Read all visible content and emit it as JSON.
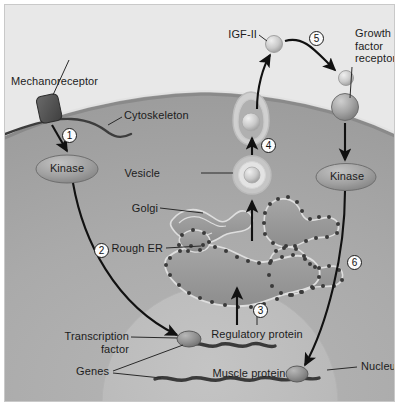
{
  "figure": {
    "type": "biological-cell-diagram"
  },
  "labels": {
    "mechanoreceptor": "Mechanoreceptor",
    "cytoskeleton": "Cytoskeleton",
    "kinase_left": "Kinase",
    "kinase_right": "Kinase",
    "vesicle": "Vesicle",
    "golgi": "Golgi",
    "rough_er": "Rough ER",
    "igf2": "IGF-II",
    "growth_factor_receptor": "Growth\nfactor\nreceptor",
    "transcription_factor": "Transcription\nfactor",
    "genes": "Genes",
    "regulatory_protein": "Regulatory protein",
    "muscle_protein": "Muscle protein",
    "nucleus": "Nucleus"
  },
  "steps": [
    {
      "id": "1",
      "number": "1",
      "description": "Mechanoreceptor activates kinase"
    },
    {
      "id": "2",
      "number": "2",
      "description": "Kinase signal travels to transcription factor in nucleus"
    },
    {
      "id": "3",
      "number": "3",
      "description": "Regulatory protein translated at rough ER"
    },
    {
      "id": "4",
      "number": "4",
      "description": "Vesicle transports product to plasma membrane for exocytosis"
    },
    {
      "id": "5",
      "number": "5",
      "description": "Secreted IGF-II binds growth factor receptor"
    },
    {
      "id": "6",
      "number": "6",
      "description": "Receptor kinase signals nucleus to express muscle protein gene"
    }
  ],
  "colors": {
    "extracellular": "#e8e8e8",
    "cytoplasm": "#a9a9a9",
    "nucleus": "#b9b9b9",
    "membrane": "#8f8f8f",
    "organelle_fill": "#9a9a9a",
    "organelle_outline": "#d8d8d8",
    "protein_dark": "#4a4a4a",
    "text": "#1c1c1c",
    "arrow": "#111111",
    "ribosome": "#3d3d3d",
    "gene_strand": "#3a3a3a"
  }
}
